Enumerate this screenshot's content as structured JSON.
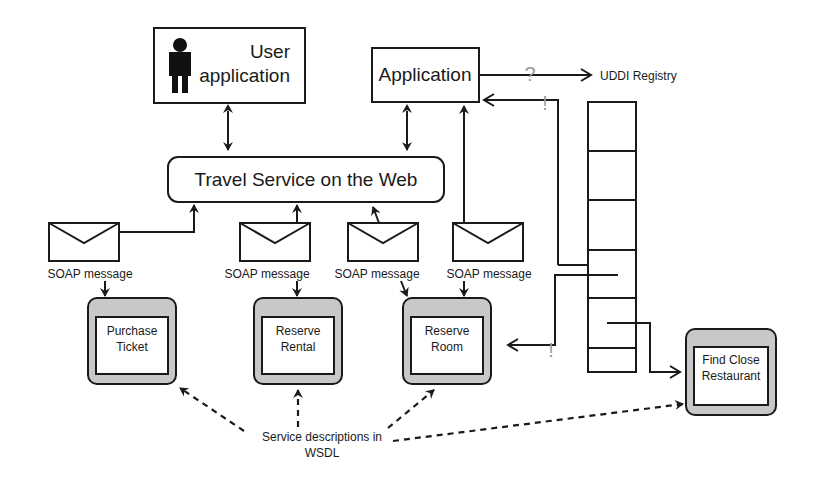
{
  "diagram": {
    "user_app": {
      "line1": "User",
      "line2": "application",
      "icon": "person-icon"
    },
    "application": {
      "label": "Application"
    },
    "uddi": {
      "label": "UDDI Registry",
      "query_mark": "?",
      "reply_mark": "!"
    },
    "travel_service": {
      "label": "Travel Service on the Web"
    },
    "soap_messages": [
      {
        "label": "SOAP message",
        "icon": "envelope-icon"
      },
      {
        "label": "SOAP message",
        "icon": "envelope-icon"
      },
      {
        "label": "SOAP message",
        "icon": "envelope-icon"
      },
      {
        "label": "SOAP message",
        "icon": "envelope-icon"
      }
    ],
    "services": [
      {
        "line1": "Purchase",
        "line2": "Ticket"
      },
      {
        "line1": "Reserve",
        "line2": "Rental"
      },
      {
        "line1": "Reserve",
        "line2": "Room"
      },
      {
        "line1": "Find Close",
        "line2": "Restaurant"
      }
    ],
    "registry_reply_mark": "!",
    "wsdl_note": {
      "line1": "Service descriptions in",
      "line2": "WSDL"
    },
    "colors": {
      "line": "#1a1a1a",
      "service_frame": "#c8c8c8",
      "mark": "#9a9a9a",
      "background": "#ffffff"
    }
  }
}
